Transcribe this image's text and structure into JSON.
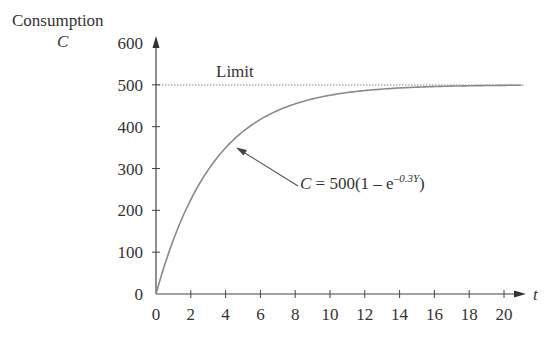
{
  "chart_data": {
    "type": "line",
    "title": "",
    "xlabel": "t",
    "ylabel": "Consumption",
    "ylabel_symbol": "C",
    "xlim": [
      0,
      21
    ],
    "ylim": [
      0,
      600
    ],
    "grid": false,
    "x_ticks": [
      0,
      2,
      4,
      6,
      8,
      10,
      12,
      14,
      16,
      18,
      20
    ],
    "y_ticks": [
      0,
      100,
      200,
      300,
      400,
      500,
      600
    ],
    "series": [
      {
        "name": "C = 500(1 − e^(−0.3Y))",
        "formula": "500*(1-exp(-0.3*t))",
        "x": [
          0,
          2,
          4,
          6,
          8,
          10,
          12,
          14,
          16,
          18,
          20
        ],
        "values": [
          0,
          225.6,
          349.4,
          417.4,
          454.6,
          475.1,
          486.3,
          492.5,
          495.9,
          497.7,
          498.8
        ],
        "color": "#8a8a8a",
        "style": "solid"
      },
      {
        "name": "Limit",
        "x": [
          0,
          21
        ],
        "values": [
          500,
          500
        ],
        "color": "#888888",
        "style": "dotted"
      }
    ],
    "annotations": [
      {
        "text": "Limit",
        "x": 3.5,
        "y": 515
      },
      {
        "text_main": "C = 500(1 − e",
        "text_sup": "−0.3Y",
        "text_end": ")",
        "points_to": {
          "x": 4.5,
          "y": 370
        }
      }
    ]
  },
  "labels": {
    "y_title": "Consumption",
    "y_symbol": "C",
    "x_symbol": "t",
    "limit": "Limit",
    "eq_C": "C",
    "eq_mid": " = 500(1 – e",
    "eq_sup": "–0.3Y",
    "eq_end": ")",
    "x_ticks": [
      "0",
      "2",
      "4",
      "6",
      "8",
      "10",
      "12",
      "14",
      "16",
      "18",
      "20"
    ],
    "y_ticks": [
      "0",
      "100",
      "200",
      "300",
      "400",
      "500",
      "600"
    ]
  }
}
